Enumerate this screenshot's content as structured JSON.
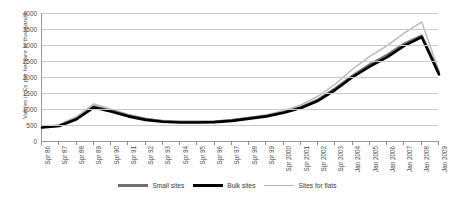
{
  "chart_data": {
    "type": "line",
    "title": "",
    "xlabel": "",
    "ylabel": "Values in £s per hectare in thousands",
    "ylim": [
      0,
      4000
    ],
    "ytick_step": 500,
    "yticks": [
      0,
      500,
      1000,
      1500,
      2000,
      2500,
      3000,
      3500,
      4000
    ],
    "grid": true,
    "legend_position": "bottom",
    "categories": [
      "Spr 86",
      "Spr 87",
      "Spr 88",
      "Spr 89",
      "Spr 90",
      "Spr 91",
      "Spr 92",
      "Spr 93",
      "Spr 94",
      "Spr 95",
      "Spr 96",
      "Spr 97",
      "Spr 98",
      "Spr 99",
      "Spr 2000",
      "Spr 2001",
      "Spr 2002",
      "Spr 2003",
      "Jan 2004",
      "Jan 2005",
      "Jan 2006",
      "Jan 2007",
      "Jan 2008",
      "Jan 2009"
    ],
    "series": [
      {
        "name": "Small sites",
        "color": "#6f6f6f",
        "values": [
          430,
          480,
          700,
          1080,
          950,
          800,
          690,
          620,
          600,
          600,
          610,
          650,
          720,
          790,
          900,
          1060,
          1300,
          1650,
          2050,
          2400,
          2700,
          3050,
          3300,
          2150
        ]
      },
      {
        "name": "Bulk sites",
        "color": "#000000",
        "values": [
          420,
          470,
          680,
          1050,
          920,
          770,
          660,
          600,
          580,
          580,
          590,
          630,
          700,
          770,
          880,
          1030,
          1260,
          1600,
          2000,
          2330,
          2620,
          2980,
          3250,
          2080
        ]
      },
      {
        "name": "Sites for flats",
        "color": "#b4b4b4",
        "values": [
          450,
          510,
          760,
          1160,
          1000,
          830,
          710,
          640,
          620,
          620,
          630,
          670,
          740,
          820,
          950,
          1130,
          1400,
          1780,
          2250,
          2650,
          2980,
          3380,
          3720,
          2180
        ]
      }
    ]
  },
  "legend": {
    "items": [
      {
        "label": "Small sites"
      },
      {
        "label": "Bulk sites"
      },
      {
        "label": "Sites for flats"
      }
    ]
  }
}
